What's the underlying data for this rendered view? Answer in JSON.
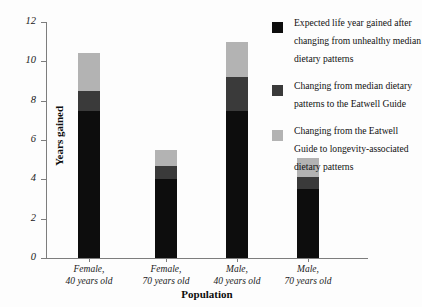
{
  "chart_data": {
    "type": "bar",
    "stacked": true,
    "title": "",
    "xlabel": "Population",
    "ylabel": "Years gained",
    "ylim": [
      0,
      12
    ],
    "ytick_labels": [
      "0",
      "2",
      "4",
      "6",
      "8",
      "10",
      "12"
    ],
    "ytick_values": [
      0,
      2,
      4,
      6,
      8,
      10,
      12
    ],
    "grid": false,
    "legend_position": "top-right",
    "categories": [
      "Female,\n40 years old",
      "Female,\n70 years old",
      "Male,\n40 years old",
      "Male,\n70 years old"
    ],
    "category_lines": [
      [
        "Female,",
        "40 years old"
      ],
      [
        "Female,",
        "70 years old"
      ],
      [
        "Male,",
        "40 years old"
      ],
      [
        "Male,",
        "70 years old"
      ]
    ],
    "series": [
      {
        "name": "Expected life year gained after changing from unhealthy median dietary patterns",
        "color": "#0d0d0d",
        "values": [
          7.5,
          4.0,
          7.5,
          3.5
        ]
      },
      {
        "name": "Changing from median dietary patterns to the Eatwell Guide",
        "color": "#3a3a3a",
        "values": [
          1.0,
          0.7,
          1.7,
          0.6
        ]
      },
      {
        "name": "Changing from the Eatwell Guide to longevity-associated dietary patterns",
        "color": "#b3b3b3",
        "values": [
          1.9,
          0.8,
          1.8,
          1.0
        ]
      }
    ],
    "totals": [
      10.4,
      5.5,
      11.0,
      5.1
    ]
  },
  "legend": {
    "items": [
      {
        "swatch_name": "legend-swatch-black",
        "color": "#0d0d0d",
        "label": "Expected life year gained after changing from unhealthy median dietary patterns"
      },
      {
        "swatch_name": "legend-swatch-dark-gray",
        "color": "#3a3a3a",
        "label": "Changing from median dietary patterns to the Eatwell Guide"
      },
      {
        "swatch_name": "legend-swatch-light-gray",
        "color": "#b3b3b3",
        "label": "Changing from the Eatwell Guide to longevity-associated dietary patterns"
      }
    ]
  },
  "axes": {
    "y_title": "Years gained",
    "x_title": "Population"
  }
}
